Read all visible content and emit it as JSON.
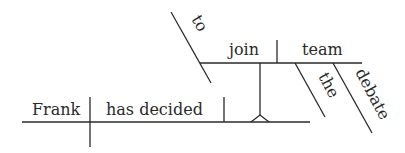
{
  "diagram": {
    "type": "Reed-Kellogg sentence diagram",
    "sentence": "Frank has decided to join the debate team",
    "subject": "Frank",
    "verb": "has decided",
    "object_phrase": {
      "marker": "to",
      "verb": "join",
      "object": "team",
      "modifiers": [
        "the",
        "debate"
      ]
    },
    "colors": {
      "line": "#2a2a2a",
      "background": "#ffffff"
    }
  }
}
